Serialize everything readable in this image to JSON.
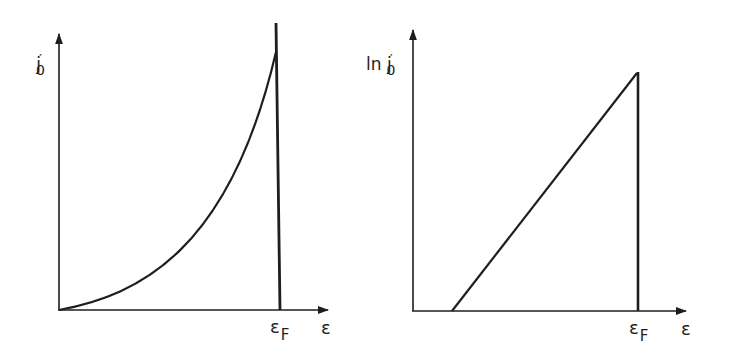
{
  "figure": {
    "panels": [
      {
        "id": "left",
        "y_label": {
          "main": "j",
          "prime": "′",
          "sub": "0"
        },
        "x_label": "ε",
        "x_marker": {
          "main": "ε",
          "sub": "F"
        },
        "curve": "convex rising curve from origin to a peak at εF, then vertical drop to axis"
      },
      {
        "id": "right",
        "y_label": {
          "prefix": "ln ",
          "main": "j",
          "prime": "′",
          "sub": "0"
        },
        "x_label": "ε",
        "x_marker": {
          "main": "ε",
          "sub": "F"
        },
        "curve": "straight line rising from a point right of origin to εF, then vertical drop to axis"
      }
    ],
    "colors": {
      "ink": "#1e1e1e",
      "background": "#ffffff"
    }
  }
}
